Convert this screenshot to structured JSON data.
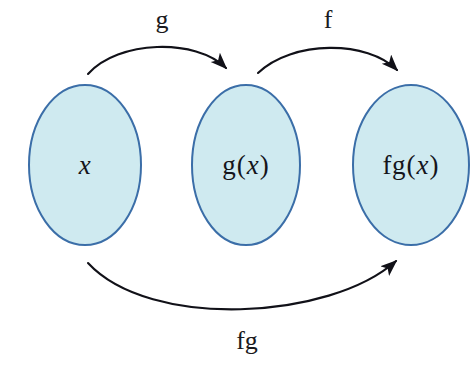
{
  "diagram": {
    "background_color": "#ffffff",
    "width": 473,
    "height": 371
  },
  "style": {
    "ellipse_fill": "#cfeaf0",
    "ellipse_stroke": "#3b6ea8",
    "ellipse_stroke_width": 2,
    "arrow_color": "#111118",
    "arrow_width": 2,
    "text_color": "#15151b"
  },
  "sets": [
    {
      "id": "set-x",
      "name": "domain-ellipse",
      "label_plain": "x",
      "parts": [
        {
          "text": "x",
          "style": "var"
        }
      ],
      "cx": 85,
      "cy": 165,
      "rx": 56,
      "ry": 80
    },
    {
      "id": "set-gx",
      "name": "intermediate-ellipse",
      "label_plain": "g(x)",
      "parts": [
        {
          "text": "g",
          "style": "fn"
        },
        {
          "text": "(",
          "style": "paren"
        },
        {
          "text": "x",
          "style": "var"
        },
        {
          "text": ")",
          "style": "paren"
        }
      ],
      "cx": 246,
      "cy": 165,
      "rx": 54,
      "ry": 80
    },
    {
      "id": "set-fgx",
      "name": "codomain-ellipse",
      "label_plain": "fg(x)",
      "parts": [
        {
          "text": "fg",
          "style": "fn"
        },
        {
          "text": "(",
          "style": "paren"
        },
        {
          "text": "x",
          "style": "var"
        },
        {
          "text": ")",
          "style": "paren"
        }
      ],
      "cx": 411,
      "cy": 165,
      "rx": 58,
      "ry": 80
    }
  ],
  "arrows": [
    {
      "id": "arrow-g",
      "name": "arrow-g",
      "label": "g",
      "from": "set-x",
      "to": "set-gx",
      "label_x": 162,
      "label_y": 20,
      "path": "M 88 74 C 118 40, 196 38, 226 68",
      "direction": "left-to-right-over"
    },
    {
      "id": "arrow-f",
      "name": "arrow-f",
      "label": "f",
      "from": "set-gx",
      "to": "set-fgx",
      "label_x": 328,
      "label_y": 20,
      "path": "M 258 73 C 292 40, 368 40, 397 70",
      "direction": "left-to-right-over"
    },
    {
      "id": "arrow-fg",
      "name": "arrow-fg",
      "label": "fg",
      "from": "set-x",
      "to": "set-fgx",
      "label_x": 247,
      "label_y": 341,
      "path": "M 88 263 C 150 330, 330 320, 396 261",
      "direction": "left-to-right-under"
    }
  ]
}
